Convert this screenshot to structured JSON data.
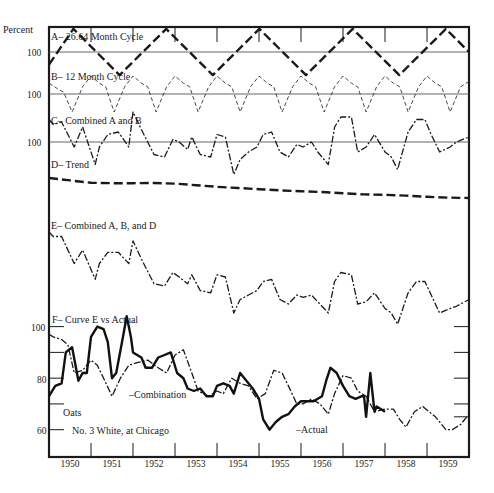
{
  "chart_data": {
    "type": "line",
    "title": "",
    "ylabel": "Percent",
    "xlabel": "",
    "x_tick_labels": [
      "1950",
      "1951",
      "1952",
      "1953",
      "1954",
      "1955",
      "1956",
      "1957",
      "1958",
      "1959"
    ],
    "xlim": [
      1950.0,
      1960.0
    ],
    "panels": [
      {
        "id": "A",
        "label": "A– 26.64 Month Cycle",
        "baseline_label": "100",
        "style": "heavy-dash",
        "units": "percent deviation from 100",
        "series": [
          {
            "name": "26.64 Month Cycle",
            "x": [
              1950.0,
              1950.58,
              1951.68,
              1952.79,
              1953.9,
              1955.01,
              1956.12,
              1957.23,
              1958.34,
              1959.45,
              1960.0
            ],
            "y": [
              -6,
              11,
              -11,
              11,
              -11,
              11,
              -11,
              11,
              -11,
              11,
              0
            ]
          }
        ]
      },
      {
        "id": "B",
        "label": "B– 12 Month Cycle",
        "baseline_label": "100",
        "style": "light-dash",
        "units": "percent deviation from 100",
        "series": [
          {
            "name": "12 Month Cycle",
            "x": [
              1950.0,
              1950.2,
              1950.35,
              1950.55,
              1950.8,
              1951.0,
              1951.2,
              1951.35,
              1951.55,
              1951.8,
              1952.0,
              1952.2,
              1952.35,
              1952.55,
              1952.8,
              1953.0,
              1953.2,
              1953.35,
              1953.55,
              1953.8,
              1954.0,
              1954.2,
              1954.35,
              1954.55,
              1954.8,
              1955.0,
              1955.2,
              1955.35,
              1955.55,
              1955.8,
              1956.0,
              1956.2,
              1956.35,
              1956.55,
              1956.8,
              1957.0,
              1957.2,
              1957.35,
              1957.55,
              1957.8,
              1958.0,
              1958.2,
              1958.35,
              1958.55,
              1958.8,
              1959.0,
              1959.2,
              1959.35,
              1959.55,
              1959.8,
              1960.0
            ],
            "y": [
              6,
              3,
              1,
              -10,
              4,
              10,
              6,
              4,
              -10,
              4,
              10,
              6,
              4,
              -10,
              4,
              10,
              6,
              4,
              -10,
              4,
              10,
              6,
              4,
              -10,
              4,
              10,
              6,
              4,
              -10,
              4,
              10,
              6,
              4,
              -10,
              4,
              10,
              6,
              4,
              -10,
              4,
              10,
              6,
              4,
              -10,
              4,
              10,
              6,
              4,
              -10,
              4,
              7
            ]
          }
        ]
      },
      {
        "id": "C",
        "label": "C– Combined A and B",
        "baseline_label": "100",
        "style": "dash-dot",
        "units": "percent deviation from 100",
        "series": [
          {
            "name": "Combined A and B",
            "x": [
              1950.0,
              1950.1,
              1950.3,
              1950.6,
              1950.8,
              1951.1,
              1951.2,
              1951.4,
              1951.65,
              1951.9,
              1952.0,
              1952.2,
              1952.5,
              1952.75,
              1952.95,
              1953.1,
              1953.3,
              1953.4,
              1953.6,
              1953.85,
              1954.0,
              1954.2,
              1954.4,
              1954.55,
              1954.75,
              1954.95,
              1955.1,
              1955.3,
              1955.5,
              1955.7,
              1955.9,
              1956.05,
              1956.25,
              1956.4,
              1956.65,
              1956.8,
              1956.95,
              1957.2,
              1957.35,
              1957.55,
              1957.75,
              1958.0,
              1958.15,
              1958.3,
              1958.55,
              1958.75,
              1958.95,
              1959.1,
              1959.3,
              1959.55,
              1959.7,
              1960.0
            ],
            "y": [
              9,
              7,
              8,
              -2,
              6,
              -9,
              -2,
              3,
              4,
              -2,
              12,
              5,
              -5,
              -6,
              1,
              0,
              -3,
              2,
              -5,
              -6,
              3,
              2,
              -13,
              -7,
              -4,
              -2,
              3,
              4,
              -4,
              -6,
              -1,
              -2,
              0,
              -4,
              -9,
              6,
              10,
              10,
              -4,
              -2,
              3,
              -4,
              -6,
              -11,
              4,
              9,
              9,
              3,
              -4,
              -2,
              0,
              2
            ]
          }
        ]
      },
      {
        "id": "D",
        "label": "D– Trend",
        "style": "heavy-dash",
        "units": "relative level",
        "series": [
          {
            "name": "Trend",
            "x": [
              1950.0,
              1950.5,
              1951.0,
              1951.5,
              1952.0,
              1952.5,
              1953.0,
              1953.5,
              1954.0,
              1954.5,
              1955.0,
              1955.5,
              1956.0,
              1956.5,
              1957.0,
              1957.5,
              1958.0,
              1958.5,
              1959.0,
              1959.5,
              1960.0
            ],
            "y": [
              100,
              97,
              94,
              93.5,
              93.5,
              93.8,
              93,
              91,
              89,
              87.5,
              86,
              84.5,
              83.5,
              82.5,
              81,
              79.5,
              79,
              78,
              76.5,
              75.5,
              75
            ]
          }
        ]
      },
      {
        "id": "E",
        "label": "E– Combined A, B, and D",
        "style": "dash-dot",
        "units": "relative level",
        "series": [
          {
            "name": "Combined A, B, and D",
            "x": [
              1950.0,
              1950.1,
              1950.3,
              1950.6,
              1950.8,
              1951.1,
              1951.2,
              1951.4,
              1951.65,
              1951.9,
              1952.0,
              1952.2,
              1952.5,
              1952.75,
              1952.95,
              1953.1,
              1953.3,
              1953.4,
              1953.6,
              1953.85,
              1954.0,
              1954.2,
              1954.4,
              1954.55,
              1954.75,
              1954.95,
              1955.1,
              1955.3,
              1955.5,
              1955.7,
              1955.9,
              1956.05,
              1956.25,
              1956.4,
              1956.65,
              1956.8,
              1956.95,
              1957.2,
              1957.35,
              1957.55,
              1957.75,
              1958.0,
              1958.15,
              1958.3,
              1958.55,
              1958.75,
              1958.95,
              1959.1,
              1959.3,
              1959.55,
              1959.7,
              1960.0
            ],
            "y": [
              100,
              98,
              98,
              86,
              92,
              79,
              86,
              91,
              91,
              86,
              96,
              88,
              77,
              76,
              82,
              80,
              77,
              81,
              74,
              73,
              81,
              80,
              64,
              70,
              72,
              74,
              78,
              79,
              70,
              68,
              72,
              71,
              72,
              69,
              64,
              78,
              82,
              81,
              68,
              69,
              73,
              66,
              64,
              59,
              73,
              78,
              78,
              72,
              64,
              66,
              67,
              70
            ]
          }
        ]
      },
      {
        "id": "F",
        "label": "F– Curve E vs Actual",
        "y_tick_labels": [
          "100",
          "80",
          "60"
        ],
        "ylim": [
          56,
          108
        ],
        "commodity_label": "Oats",
        "commodity_sub_label": "No. 3 White, at Chicago",
        "series": [
          {
            "name": "Combination",
            "annotation": "–Combination",
            "style": "dash-dot",
            "x": [
              1950.0,
              1950.1,
              1950.3,
              1950.45,
              1950.6,
              1950.8,
              1951.0,
              1951.15,
              1951.3,
              1951.5,
              1951.7,
              1951.9,
              1952.1,
              1952.35,
              1952.6,
              1952.8,
              1953.0,
              1953.2,
              1953.4,
              1953.55,
              1953.8,
              1954.0,
              1954.15,
              1954.35,
              1954.55,
              1954.75,
              1954.95,
              1955.15,
              1955.35,
              1955.55,
              1955.7,
              1955.9,
              1956.05,
              1956.25,
              1956.45,
              1956.65,
              1956.8,
              1957.0,
              1957.2,
              1957.35,
              1957.55,
              1957.75,
              1958.0,
              1958.2,
              1958.35,
              1958.5,
              1958.7,
              1958.9,
              1959.05,
              1959.2,
              1959.45,
              1959.6,
              1959.8,
              1960.0
            ],
            "y": [
              97,
              96,
              95,
              93,
              82,
              83,
              87,
              85,
              80,
              73,
              80,
              85,
              86,
              87,
              84,
              82,
              89,
              91,
              82,
              75,
              73,
              75,
              74,
              80,
              78,
              77,
              72,
              74,
              83,
              82,
              77,
              70,
              70,
              72,
              70,
              66,
              74,
              81,
              80,
              75,
              73,
              67,
              68,
              68,
              64,
              61,
              67,
              69,
              67,
              65,
              60,
              60,
              62,
              66
            ]
          },
          {
            "name": "Actual",
            "annotation": "–Actual",
            "style": "solid-heavy",
            "x": [
              1950.0,
              1950.15,
              1950.3,
              1950.4,
              1950.55,
              1950.7,
              1950.8,
              1950.9,
              1951.0,
              1951.15,
              1951.3,
              1951.4,
              1951.5,
              1951.6,
              1951.75,
              1951.85,
              1951.95,
              1952.0,
              1952.1,
              1952.2,
              1952.3,
              1952.45,
              1952.6,
              1952.75,
              1952.9,
              1953.05,
              1953.2,
              1953.3,
              1953.45,
              1953.6,
              1953.75,
              1953.9,
              1954.0,
              1954.15,
              1954.3,
              1954.4,
              1954.55,
              1954.7,
              1954.85,
              1955.0,
              1955.1,
              1955.25,
              1955.4,
              1955.55,
              1955.7,
              1955.85,
              1956.0,
              1956.15,
              1956.3,
              1956.5,
              1956.6,
              1956.7,
              1956.85,
              1957.0,
              1957.15,
              1957.3,
              1957.45,
              1957.5,
              1957.55,
              1957.65,
              1957.75,
              1957.8,
              1957.9,
              1958.0
            ],
            "y": [
              73,
              77,
              78,
              90,
              92,
              79,
              82,
              82,
              96,
              100,
              99,
              94,
              80,
              82,
              95,
              104,
              96,
              90,
              89,
              88,
              84,
              84,
              88,
              89,
              90,
              82,
              80,
              76,
              75,
              76,
              73,
              73,
              77,
              78,
              77,
              74,
              82,
              79,
              76,
              72,
              64,
              60,
              63,
              65,
              66,
              69,
              71,
              71,
              71,
              73,
              79,
              84,
              82,
              77,
              73,
              72,
              73,
              73,
              65,
              82,
              67,
              69,
              68,
              67
            ]
          }
        ]
      }
    ]
  }
}
